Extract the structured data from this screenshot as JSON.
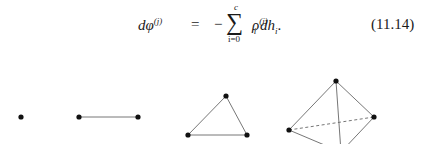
{
  "equation": {
    "lhs": "dφ",
    "lhs_sup": "(j)",
    "equals": "=",
    "minus": "−",
    "sum_symbol": "∑",
    "sum_upper": "c",
    "sum_lower": "i=0",
    "rho": "ρ",
    "rho_sup": "(j)",
    "rho_sub": "i",
    "tail": " dh",
    "tail_sub": "i",
    "period": ".",
    "number": "(11.14)"
  },
  "figure": {
    "simplices": [
      {
        "name": "0-simplex (point)",
        "vertices": [
          [
            21,
            117
          ]
        ],
        "edges": []
      },
      {
        "name": "1-simplex (segment)",
        "vertices": [
          [
            79,
            117
          ],
          [
            138,
            117
          ]
        ],
        "edges": [
          [
            0,
            1
          ]
        ]
      },
      {
        "name": "2-simplex (triangle)",
        "vertices": [
          [
            188,
            135
          ],
          [
            226,
            96
          ],
          [
            247,
            135
          ]
        ],
        "edges": [
          [
            0,
            1
          ],
          [
            1,
            2
          ],
          [
            0,
            2
          ]
        ]
      },
      {
        "name": "3-simplex (tetrahedron)",
        "vertices": [
          [
            336,
            81
          ],
          [
            289,
            130
          ],
          [
            374,
            117
          ],
          [
            341,
            152
          ]
        ],
        "edges": [
          [
            0,
            1
          ],
          [
            0,
            2
          ],
          [
            0,
            3
          ],
          [
            1,
            3
          ],
          [
            2,
            3
          ]
        ],
        "dashed_edges": [
          [
            1,
            2
          ]
        ]
      }
    ]
  }
}
